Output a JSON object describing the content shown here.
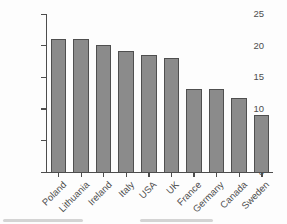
{
  "chart_data": {
    "type": "bar",
    "title": "",
    "xlabel": "",
    "ylabel": "% of families in poverty",
    "categories": [
      "Poland",
      "Lithuania",
      "Ireland",
      "Italy",
      "USA",
      "UK",
      "France",
      "Germany",
      "Canada",
      "Sweden"
    ],
    "values": [
      21,
      21,
      20,
      19,
      18.5,
      18,
      13,
      13,
      11.7,
      9
    ],
    "ylim": [
      0,
      25
    ],
    "yticks": [
      0,
      5,
      10,
      15,
      20,
      25
    ],
    "grid": false,
    "legend": false,
    "bar_color": "#8b8b8b",
    "bar_border_color": "#4f4f4f",
    "axis_color": "#4d4d4d",
    "text_color": "#4d4d4d"
  }
}
